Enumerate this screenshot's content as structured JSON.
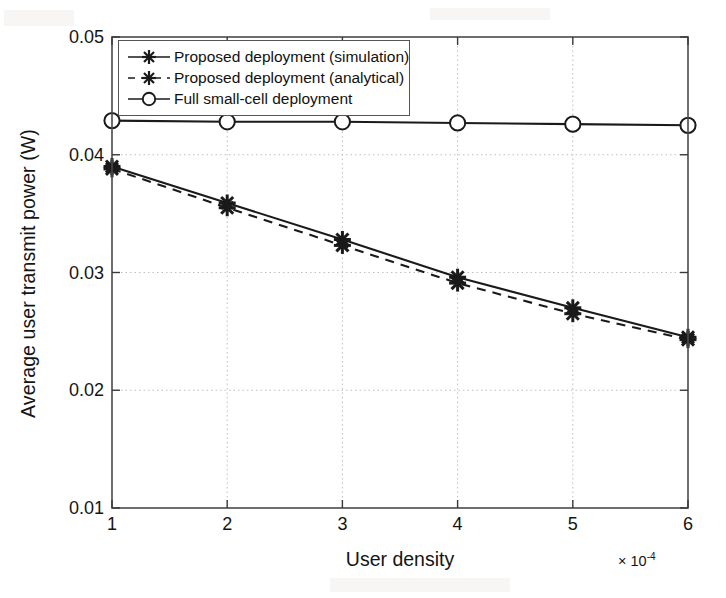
{
  "chart_data": {
    "type": "line",
    "title": "",
    "xlabel": "User density",
    "ylabel": "Average user transmit power (W)",
    "x_multiplier": "× 10",
    "x_multiplier_exp": "-4",
    "x": [
      1,
      2,
      3,
      4,
      5,
      6
    ],
    "xlim": [
      1,
      6
    ],
    "ylim": [
      0.01,
      0.05
    ],
    "xticks": [
      "1",
      "2",
      "3",
      "4",
      "5",
      "6"
    ],
    "yticks": [
      "0.01",
      "0.02",
      "0.03",
      "0.04",
      "0.05"
    ],
    "ytick_values": [
      0.01,
      0.02,
      0.03,
      0.04,
      0.05
    ],
    "grid": true,
    "legend_position": "upper-left",
    "series": [
      {
        "name": "Proposed deployment (simulation)",
        "marker": "star",
        "linestyle": "solid",
        "color": "#1a1a1a",
        "values": [
          0.039,
          0.0359,
          0.0328,
          0.0296,
          0.027,
          0.0245
        ]
      },
      {
        "name": "Proposed deployment (analytical)",
        "marker": "star",
        "linestyle": "dashed",
        "color": "#1a1a1a",
        "values": [
          0.0388,
          0.0355,
          0.0323,
          0.0291,
          0.0265,
          0.0243
        ]
      },
      {
        "name": "Full small-cell deployment",
        "marker": "circle",
        "linestyle": "solid",
        "color": "#1a1a1a",
        "values": [
          0.0429,
          0.0428,
          0.0428,
          0.0427,
          0.0426,
          0.0425
        ]
      }
    ]
  },
  "legend": {
    "items": [
      {
        "label": "Proposed deployment (simulation)",
        "marker": "star-marker-icon",
        "linestyle": "solid"
      },
      {
        "label": "Proposed deployment (analytical)",
        "marker": "star-marker-icon",
        "linestyle": "dashed"
      },
      {
        "label": "Full small-cell deployment",
        "marker": "circle-marker-icon",
        "linestyle": "solid"
      }
    ]
  }
}
